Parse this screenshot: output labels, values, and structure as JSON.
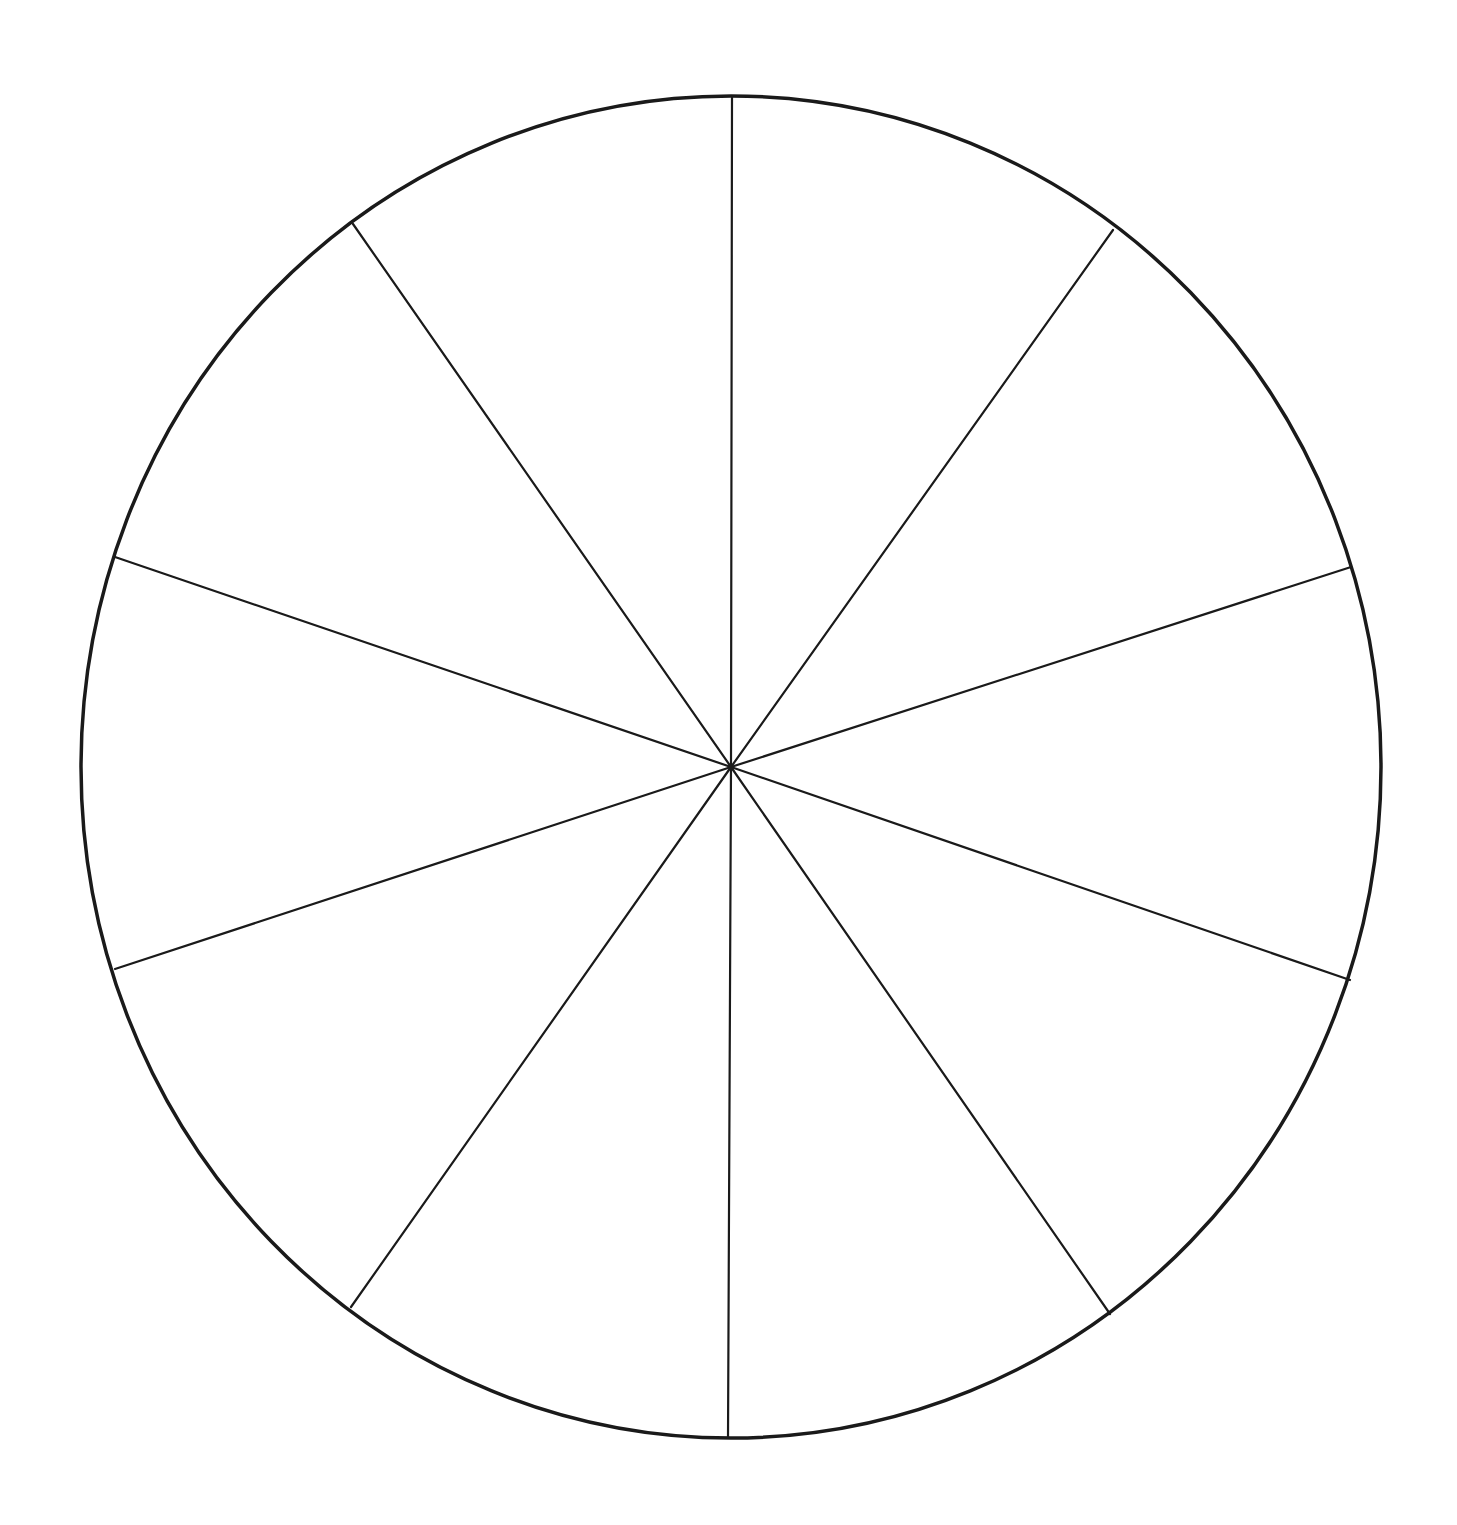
{
  "diagram": {
    "type": "blank-segmented-wheel",
    "segment_count": 10,
    "canvas": {
      "width": 1457,
      "height": 1525
    },
    "background_color": "#ffffff",
    "line_color": "#1a1a1a",
    "center": {
      "x": 731,
      "y": 767
    },
    "rim": {
      "cx": 731,
      "cy": 767,
      "rx": 650,
      "ry": 671
    },
    "spokes": [
      {
        "id": "spoke-top",
        "x": 732,
        "y": 96
      },
      {
        "id": "spoke-upper-right",
        "x": 1113,
        "y": 230
      },
      {
        "id": "spoke-right-upper",
        "x": 1351,
        "y": 567
      },
      {
        "id": "spoke-right-lower",
        "x": 1350,
        "y": 980
      },
      {
        "id": "spoke-lower-right",
        "x": 1110,
        "y": 1314
      },
      {
        "id": "spoke-bottom",
        "x": 728,
        "y": 1438
      },
      {
        "id": "spoke-lower-left",
        "x": 351,
        "y": 1307
      },
      {
        "id": "spoke-left-lower",
        "x": 115,
        "y": 969
      },
      {
        "id": "spoke-left-upper",
        "x": 115,
        "y": 557
      },
      {
        "id": "spoke-upper-left",
        "x": 353,
        "y": 224
      }
    ],
    "segment_labels": [
      "",
      "",
      "",
      "",
      "",
      "",
      "",
      "",
      "",
      ""
    ]
  }
}
